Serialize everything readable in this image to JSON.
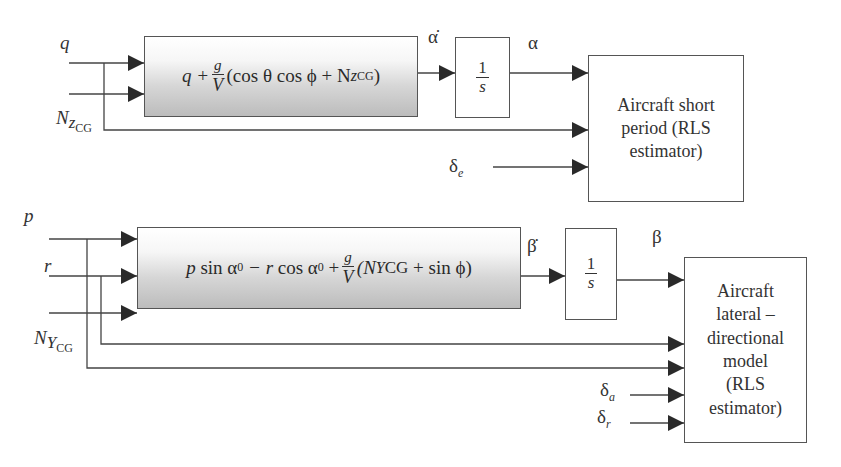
{
  "top_loop": {
    "inputs": {
      "q": "q",
      "nz_main": "N",
      "nz_sub1": "z",
      "nz_sub2": "CG"
    },
    "equation_block": {
      "lead": "q +",
      "frac_num": "g",
      "frac_den": "V",
      "body": "(cos θ cos ϕ + N",
      "sub1": "z",
      "sub2": "CG",
      "close": ")"
    },
    "derivative_label": "α̇",
    "integrator": {
      "num": "1",
      "den": "s"
    },
    "output_label": "α",
    "control_input": {
      "main": "δ",
      "sub": "e"
    },
    "estimator_block": {
      "text": [
        "Aircraft short",
        "period (RLS",
        "estimator)"
      ]
    }
  },
  "bottom_loop": {
    "inputs": {
      "p": "p",
      "r": "r",
      "ny_main": "N",
      "ny_sub1": "Y",
      "ny_sub2": "CG"
    },
    "equation_block": {
      "p": "p",
      "sin_alpha": "sin α",
      "alpha_sub": "0",
      "minus_r": "− r",
      "cos_alpha": "cos α",
      "alpha_sub2": "0",
      "plus": "+",
      "frac_num": "g",
      "frac_den": "V",
      "open": "(N",
      "sub1": "Y",
      "sub2": "CG",
      "tail": "+ sin ϕ)"
    },
    "derivative_label": "β̇",
    "integrator": {
      "num": "1",
      "den": "s"
    },
    "output_label": "β",
    "control_inputs": [
      {
        "main": "δ",
        "sub": "a"
      },
      {
        "main": "δ",
        "sub": "r"
      }
    ],
    "estimator_block": {
      "text": [
        "Aircraft",
        "lateral –",
        "directional",
        "model",
        "(RLS",
        "estimator)"
      ]
    }
  },
  "colors": {
    "line": "#444444",
    "arrow": "#2a2a2a",
    "block_gradient_top": "#ffffff",
    "block_gradient_bottom": "#bcbcbc"
  }
}
